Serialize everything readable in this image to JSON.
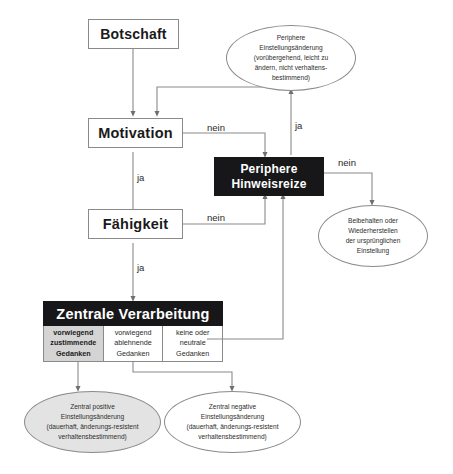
{
  "diagram": {
    "nodes": {
      "botschaft": {
        "label": "Botschaft"
      },
      "motivation": {
        "label": "Motivation"
      },
      "faehigkeit": {
        "label": "Fähigkeit"
      },
      "periphere_hinweisreize": {
        "line1": "Periphere",
        "line2": "Hinweisreize"
      },
      "zentrale_verarbeitung": {
        "header": "Zentrale Verarbeitung",
        "columns": [
          {
            "lines": [
              "vorwiegend",
              "zustimmende",
              "Gedanken"
            ],
            "shaded": true
          },
          {
            "lines": [
              "vorwiegend",
              "ablehnende",
              "Gedanken"
            ],
            "shaded": false
          },
          {
            "lines": [
              "keine oder",
              "neutrale",
              "Gedanken"
            ],
            "shaded": false
          }
        ]
      }
    },
    "outcomes": {
      "periphere_einstellungsaenderung": {
        "lines": [
          "Periphere",
          "Einstellungsänderung",
          "(vorübergehend, leicht zu",
          "ändern, nicht verhaltens-",
          "bestimmend)"
        ]
      },
      "beibehalten": {
        "lines": [
          "Beibehalten oder",
          "Wiederherstellen",
          "der ursprünglichen",
          "Einstellung"
        ]
      },
      "zentral_positive": {
        "lines": [
          "Zentral positive",
          "Einstellungsänderung",
          "(dauerhaft, änderungs-resistent",
          "verhaltensbestimmend)"
        ]
      },
      "zentral_negative": {
        "lines": [
          "Zentral negative",
          "Einstellungsänderung",
          "(dauerhaft, änderungs-resistent",
          "verhaltensbestimmend)"
        ]
      }
    },
    "edge_labels": {
      "motivation_nein": "nein",
      "motivation_ja": "ja",
      "faehigkeit_nein": "nein",
      "faehigkeit_ja": "ja",
      "periphere_ja": "ja",
      "periphere_nein": "nein"
    },
    "colors": {
      "dark_fill": "#17171a",
      "line": "#8a8a8a",
      "shaded_cell": "#d4d4d4",
      "shaded_ellipse": "#e3e3e3",
      "text": "#1a1a1a",
      "background": "#ffffff"
    }
  }
}
